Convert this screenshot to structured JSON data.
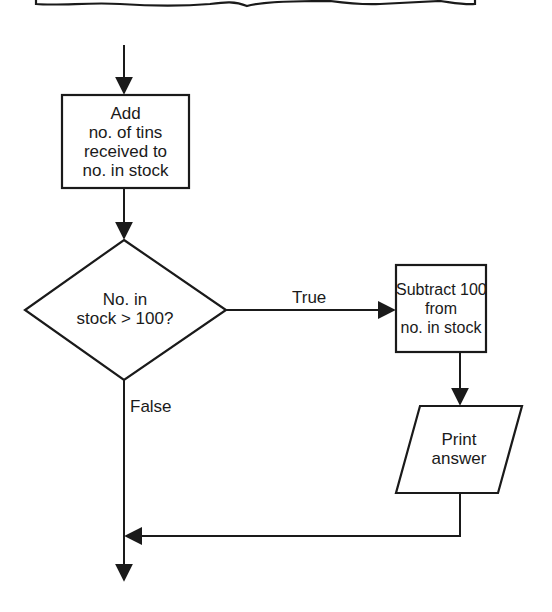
{
  "diagram": {
    "type": "flowchart",
    "colors": {
      "stroke": "#1a1a1a",
      "background": "#ffffff"
    },
    "nodes": {
      "add": {
        "shape": "process",
        "lines": [
          "Add",
          "no. of tins",
          "received to",
          "no. in stock"
        ]
      },
      "decision": {
        "shape": "decision",
        "lines": [
          "No. in",
          "stock > 100?"
        ]
      },
      "subtract": {
        "shape": "process",
        "lines": [
          "Subtract 100",
          "from",
          "no. in stock"
        ]
      },
      "print": {
        "shape": "input-output",
        "lines": [
          "Print",
          "answer"
        ]
      }
    },
    "edges": {
      "true_label": "True",
      "false_label": "False"
    }
  }
}
